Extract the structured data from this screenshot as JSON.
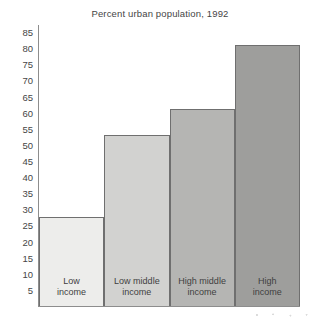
{
  "chart_data": {
    "type": "bar",
    "title": "Percent urban population, 1992",
    "xlabel": "",
    "ylabel": "",
    "categories": [
      "Low income",
      "Low middle income",
      "High middle income",
      "High income"
    ],
    "category_lines": [
      [
        "Low",
        "income"
      ],
      [
        "Low middle",
        "income"
      ],
      [
        "High middle",
        "income"
      ],
      [
        "High",
        "income"
      ]
    ],
    "values": [
      27.5,
      53,
      61,
      81
    ],
    "ylim": [
      0,
      87.5
    ],
    "yticks": [
      85,
      80,
      75,
      70,
      65,
      60,
      55,
      50,
      45,
      40,
      35,
      30,
      25,
      20,
      15,
      10,
      5
    ],
    "ytick_labels": [
      "85",
      "80",
      "75",
      "70",
      "65",
      "60",
      "55",
      "50",
      "45",
      "40",
      "35",
      "30",
      "25",
      "20",
      "15",
      "10",
      "5"
    ],
    "grid": false,
    "legend": null,
    "bar_colors": [
      "#ededeb",
      "#d2d2d0",
      "#b5b5b3",
      "#9e9e9c"
    ],
    "bar_border_color": "#6f6f6f",
    "axis_color": "#8d8d8d",
    "text_color": "#454545",
    "background": "#ffffff"
  }
}
